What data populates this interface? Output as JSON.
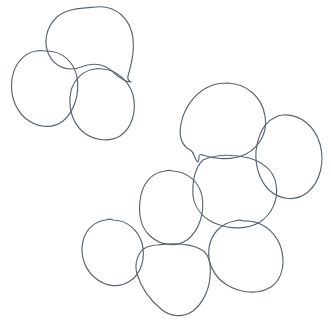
{
  "image": {
    "title": "Hand-traced cell outline figure",
    "description": "Line-drawing of nine closed irregular cell-like outlines on a plain white background, arranged as a group of three at upper-left and a cluster of six at lower-right.",
    "width": 331,
    "height": 332,
    "background_color": "#ffffff",
    "stroke_color": "#5a646e",
    "stroke_width": 1.15,
    "fill": "none",
    "object_count": 9
  },
  "groups": [
    {
      "id": "upper-left-group",
      "label": "Upper-left cluster",
      "object_count": 3
    },
    {
      "id": "lower-right-group",
      "label": "Lower-right cluster",
      "object_count": 6
    }
  ],
  "shapes": [
    {
      "id": "cell-1",
      "label": "Teardrop cell (upper left, with pointed tail)",
      "group": "upper-left-group",
      "bbox": [
        47,
        6,
        133,
        82
      ],
      "center": [
        92,
        45
      ],
      "path": "M 96 7 C 116 5 131 19 133 39 C 135 55 130 68 128 76 C 127 81 130 81 131 82 C 126 82 118 77 112 71 C 104 64 92 62 81 67 C 68 72 55 67 49 55 C 43 43 46 27 57 17 C 67 8 84 8 96 7 Z"
    },
    {
      "id": "cell-2",
      "label": "Round cell (upper-left, leftmost)",
      "group": "upper-left-group",
      "bbox": [
        11,
        50,
        78,
        127
      ],
      "center": [
        45,
        88
      ],
      "path": "M 47 51 C 62 51 74 62 77 77 C 80 94 74 112 63 121 C 51 130 36 127 25 118 C 14 108 10 93 12 79 C 14 64 24 53 36 51 C 40 50 43 51 47 51 Z"
    },
    {
      "id": "cell-3",
      "label": "Round cell (upper-left, lower right of group)",
      "group": "upper-left-group",
      "bbox": [
        69,
        68,
        135,
        141
      ],
      "center": [
        102,
        105
      ],
      "path": "M 103 69 C 117 70 129 81 133 95 C 137 111 132 128 120 136 C 108 143 92 140 82 131 C 71 121 68 105 71 91 C 74 79 84 70 95 69 C 98 68 100 69 103 69 Z"
    },
    {
      "id": "cell-4",
      "label": "Notched cell (top of lower-right cluster)",
      "group": "lower-right-group",
      "bbox": [
        180,
        82,
        267,
        162
      ],
      "center": [
        222,
        120
      ],
      "path": "M 228 83 C 247 84 262 97 265 116 C 268 133 259 147 246 154 C 232 161 214 159 203 155 C 200 154 199 155 199 157 C 199 159 199 161 198 162 C 196 161 195 158 194 155 C 193 151 190 150 187 148 C 181 143 179 134 181 124 C 184 108 194 94 208 87 C 214 84 221 83 228 83 Z"
    },
    {
      "id": "cell-5",
      "label": "Round cell (right edge of lower-right cluster)",
      "group": "lower-right-group",
      "bbox": [
        255,
        114,
        322,
        200
      ],
      "center": [
        289,
        157
      ],
      "path": "M 283 115 C 301 114 315 127 320 144 C 325 162 320 182 308 192 C 296 202 280 200 269 190 C 259 180 255 165 256 151 C 258 136 264 123 274 118 C 277 116 280 115 283 115 Z"
    },
    {
      "id": "cell-6",
      "label": "Central cell of lower-right cluster",
      "group": "lower-right-group",
      "bbox": [
        193,
        154,
        277,
        228
      ],
      "center": [
        235,
        191
      ],
      "path": "M 203 160 C 216 154 234 154 249 158 C 263 162 274 171 276 184 C 279 199 272 214 260 222 C 247 230 230 229 217 224 C 204 219 195 209 193 196 C 192 182 195 167 203 160 Z"
    },
    {
      "id": "cell-7",
      "label": "Left cell of lower-right cluster",
      "group": "lower-right-group",
      "bbox": [
        140,
        170,
        203,
        246
      ],
      "center": [
        171,
        207
      ],
      "path": "M 173 171 C 188 172 199 182 202 196 C 205 213 199 231 187 240 C 175 248 159 245 149 235 C 139 225 138 209 141 195 C 144 181 154 172 165 171 C 168 170 170 170 173 171 Z"
    },
    {
      "id": "cell-8",
      "label": "Small round cell (bottom-left of lower-right cluster)",
      "group": "lower-right-group",
      "bbox": [
        80,
        219,
        144,
        287
      ],
      "center": [
        112,
        253
      ],
      "path": "M 113 220 C 127 220 138 230 142 243 C 146 258 141 274 130 281 C 118 289 104 286 94 277 C 84 268 80 254 83 241 C 86 229 95 221 106 220 C 108 219 111 219 113 220 Z"
    },
    {
      "id": "cell-9",
      "label": "Pentagonal cell (bottom-middle)",
      "group": "lower-right-group",
      "bbox": [
        136,
        243,
        212,
        317
      ],
      "center": [
        174,
        280
      ],
      "path": "M 157 245 C 174 243 192 244 202 250 C 210 255 211 266 210 277 C 209 290 203 303 193 311 C 183 318 170 317 161 309 C 150 300 141 287 137 274 C 134 263 138 251 147 247 C 150 246 154 245 157 245 Z"
    },
    {
      "id": "cell-10",
      "label": "Round cell (bottom-right of lower-right cluster)",
      "group": "lower-right-group",
      "bbox": [
        207,
        220,
        283,
        292
      ],
      "center": [
        245,
        256
      ],
      "path": "M 243 221 C 260 220 274 230 280 245 C 286 261 283 279 271 287 C 258 295 240 293 227 285 C 214 277 207 263 209 248 C 211 234 221 223 235 221 C 238 220 241 220 243 221 Z"
    }
  ]
}
